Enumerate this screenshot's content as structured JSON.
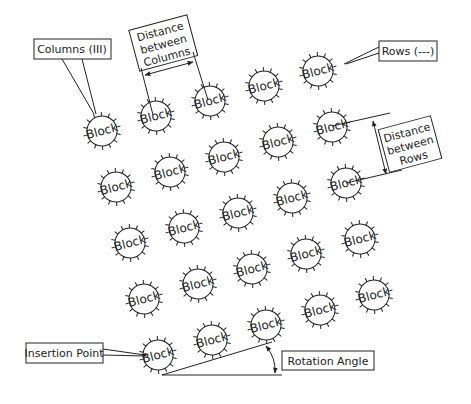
{
  "diagram": {
    "block_label": "Block",
    "grid": {
      "rows": 5,
      "columns": 5,
      "origin": [
        158,
        355
      ],
      "column_step": [
        54,
        -15
      ],
      "row_step": [
        -14,
        -56
      ],
      "block_radius": 15,
      "rotation_deg": -15
    },
    "callouts": {
      "columns": "Columns (III)",
      "rows": "Rows (---)",
      "distance_columns": [
        "Distance",
        "between",
        "Columns"
      ],
      "distance_rows": [
        "Distance",
        "between",
        "Rows"
      ],
      "insertion_point": "Insertion Point",
      "rotation_angle": "Rotation Angle"
    },
    "colors": {
      "stroke": "#222222",
      "background": "#ffffff"
    }
  }
}
